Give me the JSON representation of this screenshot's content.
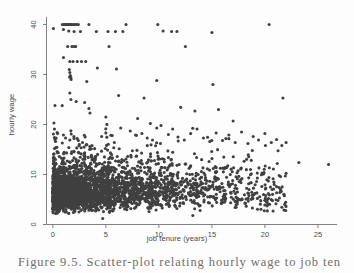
{
  "figure": {
    "caption": "Figure 9.5. Scatter-plot relating hourly wage to job ten",
    "background_color": "#fdfdfd",
    "marker_color": "#404040",
    "axis_color": "#808080",
    "label_color": "#4a4a4a"
  },
  "chart_data": {
    "type": "scatter",
    "title": "",
    "xlabel": "job tenure (years)",
    "ylabel": "hourly wage",
    "xlim": [
      -0.6,
      26.8
    ],
    "ylim": [
      0,
      41.5
    ],
    "xticks": [
      0,
      5,
      10,
      15,
      20,
      25
    ],
    "yticks": [
      0,
      10,
      20,
      30,
      40
    ],
    "grid": false,
    "legend": "none",
    "marker_size_px": 3.1,
    "points": [
      [
        0.05,
        39.2
      ],
      [
        0.1,
        20.3
      ],
      [
        0.15,
        17.4
      ],
      [
        0.2,
        17.0
      ],
      [
        0.25,
        16.6
      ],
      [
        0.3,
        15.4
      ],
      [
        0.4,
        14.6
      ],
      [
        0.12,
        13.4
      ],
      [
        0.9,
        40.0
      ],
      [
        1.05,
        40.0
      ],
      [
        1.15,
        40.0
      ],
      [
        1.25,
        40.0
      ],
      [
        1.3,
        40.0
      ],
      [
        1.4,
        40.0
      ],
      [
        1.5,
        40.0
      ],
      [
        1.6,
        40.0
      ],
      [
        1.7,
        40.0
      ],
      [
        1.8,
        40.0
      ],
      [
        1.95,
        40.0
      ],
      [
        2.1,
        40.0
      ],
      [
        2.25,
        40.0
      ],
      [
        2.4,
        40.0
      ],
      [
        3.4,
        40.0
      ],
      [
        1.0,
        39.0
      ],
      [
        1.5,
        38.7
      ],
      [
        2.0,
        38.6
      ],
      [
        2.6,
        38.6
      ],
      [
        4.1,
        38.6
      ],
      [
        5.2,
        38.6
      ],
      [
        5.9,
        38.6
      ],
      [
        6.6,
        38.6
      ],
      [
        6.9,
        40.0
      ],
      [
        9.9,
        40.0
      ],
      [
        10.4,
        38.7
      ],
      [
        11.2,
        38.6
      ],
      [
        11.7,
        38.6
      ],
      [
        15.0,
        38.4
      ],
      [
        20.4,
        40.0
      ],
      [
        1.4,
        35.6
      ],
      [
        1.8,
        35.6
      ],
      [
        2.0,
        35.6
      ],
      [
        2.15,
        35.6
      ],
      [
        5.3,
        35.6
      ],
      [
        12.5,
        35.6
      ],
      [
        1.0,
        33.4
      ],
      [
        1.6,
        32.6
      ],
      [
        1.9,
        32.6
      ],
      [
        2.3,
        32.6
      ],
      [
        2.7,
        32.6
      ],
      [
        3.1,
        32.6
      ],
      [
        1.55,
        31.0
      ],
      [
        1.6,
        30.4
      ],
      [
        1.65,
        29.8
      ],
      [
        1.7,
        29.4
      ],
      [
        1.72,
        29.0
      ],
      [
        4.2,
        31.3
      ],
      [
        6.0,
        31.1
      ],
      [
        3.2,
        28.6
      ],
      [
        9.8,
        28.8
      ],
      [
        15.1,
        28.0
      ],
      [
        0.2,
        23.8
      ],
      [
        1.6,
        26.3
      ],
      [
        1.7,
        25.0
      ],
      [
        2.2,
        24.6
      ],
      [
        3.0,
        24.4
      ],
      [
        3.4,
        23.2
      ],
      [
        3.5,
        22.3
      ],
      [
        6.2,
        25.8
      ],
      [
        8.6,
        25.3
      ],
      [
        21.7,
        25.3
      ],
      [
        5.0,
        21.5
      ],
      [
        8.0,
        21.2
      ],
      [
        9.2,
        20.2
      ],
      [
        13.4,
        22.7
      ],
      [
        17.0,
        20.7
      ],
      [
        0.15,
        19.1
      ],
      [
        0.4,
        18.4
      ],
      [
        0.45,
        18.2
      ],
      [
        1.0,
        17.9
      ],
      [
        1.2,
        17.3
      ],
      [
        1.6,
        16.9
      ],
      [
        2.0,
        17.2
      ],
      [
        2.4,
        16.8
      ],
      [
        2.8,
        16.4
      ],
      [
        3.2,
        16.0
      ],
      [
        4.6,
        17.6
      ],
      [
        5.6,
        17.8
      ],
      [
        6.4,
        19.3
      ],
      [
        7.3,
        18.7
      ],
      [
        7.8,
        17.9
      ],
      [
        8.4,
        18.2
      ],
      [
        8.9,
        17.3
      ],
      [
        9.4,
        16.9
      ],
      [
        9.8,
        19.3
      ],
      [
        10.2,
        19.8
      ],
      [
        10.9,
        18.0
      ],
      [
        11.3,
        19.1
      ],
      [
        11.8,
        17.5
      ],
      [
        12.4,
        16.9
      ],
      [
        13.0,
        18.2
      ],
      [
        13.6,
        19.1
      ],
      [
        14.2,
        17.3
      ],
      [
        14.8,
        16.6
      ],
      [
        15.4,
        18.3
      ],
      [
        16.0,
        16.8
      ],
      [
        16.6,
        17.9
      ],
      [
        17.2,
        16.4
      ],
      [
        17.8,
        18.5
      ],
      [
        18.4,
        16.2
      ],
      [
        18.9,
        17.6
      ],
      [
        19.4,
        16.9
      ],
      [
        20.0,
        18.2
      ],
      [
        20.6,
        16.4
      ],
      [
        21.1,
        17.0
      ],
      [
        21.6,
        15.8
      ],
      [
        22.0,
        16.4
      ],
      [
        0.05,
        13.2
      ],
      [
        0.1,
        12.4
      ],
      [
        0.15,
        11.6
      ],
      [
        0.2,
        10.9
      ],
      [
        0.25,
        10.2
      ],
      [
        0.3,
        9.6
      ],
      [
        0.35,
        9.0
      ],
      [
        0.4,
        8.4
      ],
      [
        0.45,
        7.8
      ],
      [
        0.5,
        7.2
      ],
      [
        0.55,
        6.7
      ],
      [
        0.6,
        6.2
      ],
      [
        0.65,
        5.7
      ],
      [
        0.7,
        5.2
      ],
      [
        0.75,
        4.8
      ],
      [
        0.8,
        4.3
      ],
      [
        0.85,
        3.9
      ],
      [
        0.9,
        3.5
      ],
      [
        0.95,
        3.1
      ],
      [
        1.0,
        2.7
      ],
      [
        23.2,
        12.4
      ],
      [
        26.0,
        12.0
      ],
      [
        21.8,
        2.9
      ],
      [
        13.2,
        1.8
      ],
      [
        4.7,
        1.2
      ]
    ],
    "summary": {
      "n_observations": 2000,
      "x_range": [
        0,
        26
      ],
      "y_range": [
        1,
        40
      ],
      "topcode_value": 40
    }
  }
}
